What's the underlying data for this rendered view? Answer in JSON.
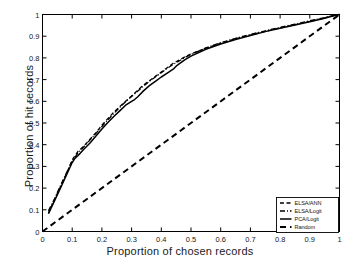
{
  "chart_data": {
    "type": "line",
    "title": "",
    "xlabel": "Proportion of chosen records",
    "ylabel": "Proportion of hit records",
    "xlim": [
      0,
      1
    ],
    "ylim": [
      0,
      1
    ],
    "grid": false,
    "legend_position": "lower-right",
    "xticks": [
      "0",
      "0.1",
      "0.2",
      "0.3",
      "0.4",
      "0.5",
      "0.6",
      "0.7",
      "0.8",
      "0.9",
      "1"
    ],
    "xtick_values": [
      0,
      0.1,
      0.2,
      0.3,
      0.4,
      0.5,
      0.6,
      0.7,
      0.8,
      0.9,
      1
    ],
    "yticks": [
      "0",
      "0.1",
      "0.2",
      "0.3",
      "0.4",
      "0.5",
      "0.6",
      "0.7",
      "0.8",
      "0.9",
      "1"
    ],
    "ytick_values": [
      0,
      0.1,
      0.2,
      0.3,
      0.4,
      0.5,
      0.6,
      0.7,
      0.8,
      0.9,
      1
    ],
    "series": [
      {
        "name": "ELSA/ANN",
        "style": "dashed",
        "color": "#000000",
        "x": [
          0.02,
          0.04,
          0.06,
          0.08,
          0.1,
          0.12,
          0.14,
          0.16,
          0.18,
          0.2,
          0.22,
          0.24,
          0.26,
          0.28,
          0.3,
          0.32,
          0.34,
          0.36,
          0.38,
          0.4,
          0.42,
          0.44,
          0.46,
          0.48,
          0.5,
          0.55,
          0.6,
          0.65,
          0.7,
          0.75,
          0.8,
          0.85,
          0.9,
          0.95,
          0.98,
          1.0
        ],
        "y": [
          0.085,
          0.145,
          0.205,
          0.265,
          0.33,
          0.37,
          0.395,
          0.425,
          0.455,
          0.49,
          0.52,
          0.55,
          0.575,
          0.6,
          0.625,
          0.65,
          0.675,
          0.695,
          0.715,
          0.735,
          0.755,
          0.775,
          0.79,
          0.805,
          0.818,
          0.845,
          0.868,
          0.888,
          0.905,
          0.922,
          0.938,
          0.953,
          0.968,
          0.984,
          0.995,
          1.0
        ]
      },
      {
        "name": "ELSA/Logit",
        "style": "dashdot",
        "color": "#000000",
        "x": [
          0.02,
          0.04,
          0.06,
          0.08,
          0.1,
          0.12,
          0.14,
          0.16,
          0.18,
          0.2,
          0.22,
          0.24,
          0.26,
          0.28,
          0.3,
          0.32,
          0.34,
          0.36,
          0.38,
          0.4,
          0.42,
          0.44,
          0.46,
          0.48,
          0.5,
          0.55,
          0.6,
          0.65,
          0.7,
          0.75,
          0.8,
          0.85,
          0.9,
          0.95,
          0.98,
          1.0
        ],
        "y": [
          0.095,
          0.15,
          0.21,
          0.268,
          0.325,
          0.362,
          0.392,
          0.422,
          0.452,
          0.484,
          0.514,
          0.544,
          0.572,
          0.598,
          0.622,
          0.646,
          0.67,
          0.692,
          0.712,
          0.732,
          0.752,
          0.77,
          0.786,
          0.802,
          0.816,
          0.846,
          0.87,
          0.89,
          0.908,
          0.925,
          0.941,
          0.956,
          0.971,
          0.986,
          0.996,
          1.0
        ]
      },
      {
        "name": "PCA/Logit",
        "style": "solid",
        "color": "#000000",
        "x": [
          0.02,
          0.04,
          0.06,
          0.08,
          0.1,
          0.11,
          0.12,
          0.14,
          0.16,
          0.18,
          0.2,
          0.22,
          0.24,
          0.26,
          0.28,
          0.3,
          0.31,
          0.32,
          0.34,
          0.36,
          0.38,
          0.4,
          0.42,
          0.44,
          0.45,
          0.46,
          0.48,
          0.5,
          0.55,
          0.6,
          0.65,
          0.7,
          0.75,
          0.8,
          0.85,
          0.9,
          0.95,
          0.98,
          1.0
        ],
        "y": [
          0.082,
          0.14,
          0.198,
          0.258,
          0.318,
          0.338,
          0.35,
          0.38,
          0.408,
          0.44,
          0.472,
          0.502,
          0.53,
          0.556,
          0.582,
          0.6,
          0.608,
          0.62,
          0.648,
          0.672,
          0.692,
          0.712,
          0.73,
          0.748,
          0.762,
          0.772,
          0.792,
          0.808,
          0.84,
          0.864,
          0.885,
          0.903,
          0.921,
          0.937,
          0.952,
          0.967,
          0.983,
          0.994,
          1.0
        ]
      },
      {
        "name": "Random",
        "style": "dashed-wide",
        "color": "#000000",
        "x": [
          0,
          1
        ],
        "y": [
          0,
          1
        ]
      }
    ]
  },
  "legend": {
    "items": [
      {
        "label": "ELSA/ANN",
        "style": "dashed"
      },
      {
        "label": "ELSA/Logit",
        "style": "dashdot"
      },
      {
        "label": "PCA/Logit",
        "style": "solid"
      },
      {
        "label": "Random",
        "style": "dashed-wide"
      }
    ]
  }
}
